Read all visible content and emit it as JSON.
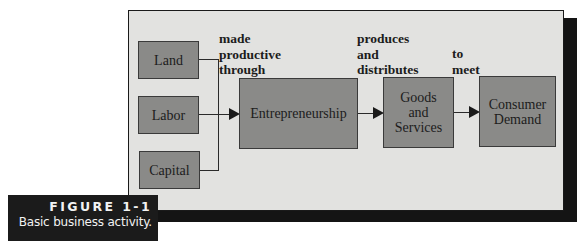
{
  "figure": {
    "number": "FIGURE 1-1",
    "caption": "Basic business activity."
  },
  "diagram": {
    "inputs": [
      {
        "label": "Land"
      },
      {
        "label": "Labor"
      },
      {
        "label": "Capital"
      }
    ],
    "nodes": {
      "entrepreneurship": "Entrepreneurship",
      "goods_services": {
        "line1": "Goods",
        "line2": "and",
        "line3": "Services"
      },
      "consumer_demand": {
        "line1": "Consumer",
        "line2": "Demand"
      }
    },
    "edge_labels": {
      "made_productive_through": {
        "line1": "made",
        "line2": "productive",
        "line3": "through"
      },
      "produces_and_distributes": {
        "line1": "produces",
        "line2": "and",
        "line3": "distributes"
      },
      "to_meet": {
        "line1": "to",
        "line2": "meet"
      }
    },
    "colors": {
      "panel_background": "#e2e2e0",
      "box_fill": "#8a8a88",
      "shadow": "#141414",
      "caption_background": "#1b1b1b",
      "caption_text": "#f2f2f2"
    }
  }
}
